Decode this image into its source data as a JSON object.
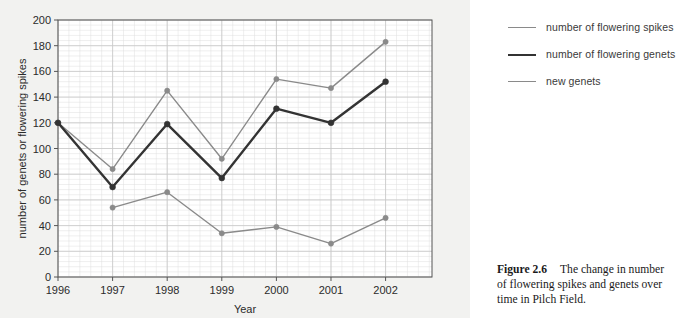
{
  "figure": {
    "caption_label": "Figure 2.6",
    "caption_text": "The change in number of flowering spikes and genets over time in Pilch Field.",
    "panel_background": "#f2f2f0"
  },
  "legend": {
    "position": "right",
    "items": [
      {
        "label": "number of flowering spikes",
        "color": "#8a8a8a",
        "width": 1.4
      },
      {
        "label": "number of flowering genets",
        "color": "#333333",
        "width": 2.4
      },
      {
        "label": "new genets",
        "color": "#8a8a8a",
        "width": 1.4
      }
    ]
  },
  "chart_data": {
    "type": "line",
    "title": "",
    "xlabel": "Year",
    "ylabel": "number of genets or flowering spikes",
    "x": [
      1996,
      1997,
      1998,
      1999,
      2000,
      2001,
      2002
    ],
    "xlim": [
      1996,
      2002.85
    ],
    "ylim": [
      0,
      200
    ],
    "xticks": [
      "1996",
      "1997",
      "1998",
      "1999",
      "2000",
      "2001",
      "2002"
    ],
    "yticks": [
      "0",
      "20",
      "40",
      "60",
      "80",
      "100",
      "120",
      "140",
      "160",
      "180",
      "200"
    ],
    "grid": true,
    "grid_minor": true,
    "grid_color": "#c8c8c8",
    "grid_minor_color": "#dedede",
    "markers": "circle",
    "series": [
      {
        "name": "number of flowering spikes",
        "color": "#8a8a8a",
        "width": 1.4,
        "values": [
          120,
          84,
          145,
          92,
          154,
          147,
          183
        ]
      },
      {
        "name": "number of flowering genets",
        "color": "#333333",
        "width": 2.4,
        "values": [
          120,
          70,
          119,
          77,
          131,
          120,
          152
        ]
      },
      {
        "name": "new genets",
        "color": "#8a8a8a",
        "width": 1.4,
        "x": [
          1997,
          1998,
          1999,
          2000,
          2001,
          2002
        ],
        "values": [
          54,
          66,
          34,
          39,
          26,
          46
        ]
      }
    ]
  }
}
